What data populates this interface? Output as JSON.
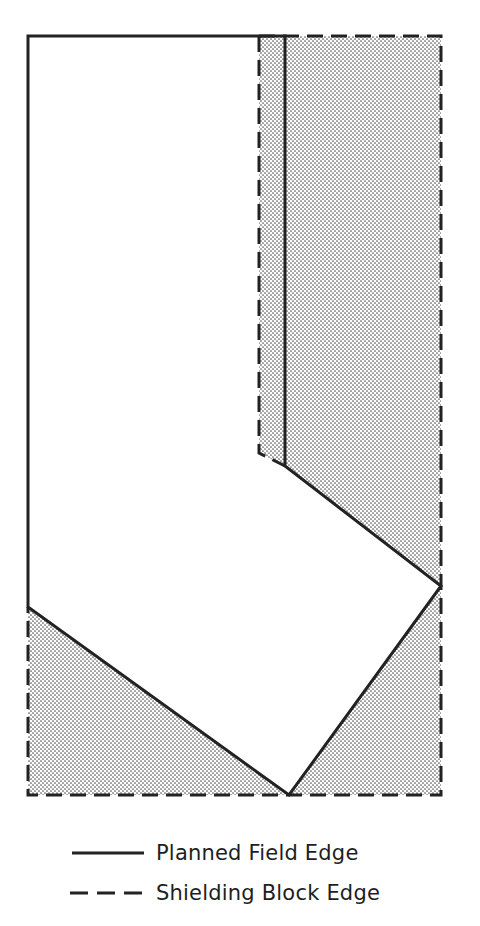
{
  "diagram": {
    "title": "",
    "colors": {
      "line": "#222222",
      "stipple": "#555555",
      "background": "#ffffff"
    },
    "planned_field_polygon": [
      [
        28,
        36
      ],
      [
        285,
        36
      ],
      [
        285,
        466
      ],
      [
        441,
        586
      ],
      [
        289,
        795
      ],
      [
        28,
        607
      ]
    ],
    "shielding_block_outline": [
      [
        259,
        36
      ],
      [
        441,
        36
      ],
      [
        441,
        795
      ],
      [
        28,
        795
      ],
      [
        28,
        607
      ]
    ],
    "shielding_block_inner_edge": [
      [
        259,
        36
      ],
      [
        259,
        453
      ],
      [
        285,
        466
      ]
    ],
    "shaded_regions": [
      {
        "name": "right-block",
        "points": [
          [
            259,
            36
          ],
          [
            441,
            36
          ],
          [
            441,
            586
          ],
          [
            285,
            466
          ],
          [
            259,
            453
          ]
        ]
      },
      {
        "name": "bottom-left-block",
        "points": [
          [
            28,
            607
          ],
          [
            289,
            795
          ],
          [
            28,
            795
          ]
        ]
      },
      {
        "name": "bottom-right-block",
        "points": [
          [
            441,
            586
          ],
          [
            441,
            795
          ],
          [
            289,
            795
          ]
        ]
      }
    ]
  },
  "legend": {
    "items": [
      {
        "label": "Planned Field Edge",
        "style": "solid"
      },
      {
        "label": "Shielding Block Edge",
        "style": "dashed"
      }
    ]
  }
}
